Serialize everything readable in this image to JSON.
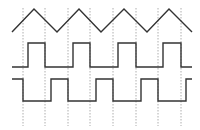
{
  "diagram": {
    "type": "timing-diagram",
    "background": "#ffffff",
    "line_color": "#333333",
    "grid_color": "#999999",
    "gridlines_x": [
      23,
      45,
      68,
      90,
      113,
      136,
      158,
      181
    ],
    "gridline_y_range": [
      8,
      126
    ],
    "signals": [
      {
        "name": "triangle-wave",
        "points": "12,32 34,9 57,32 79,9 101,32 124,9 147,32 169,9 192,32"
      },
      {
        "name": "square-wave-1",
        "points": "12,67 28,67 28,43 45,43 45,67 73,67 73,43 90,43 90,67 118,67 118,43 136,43 136,67 163,67 163,43 181,43 181,67 192,67"
      },
      {
        "name": "square-wave-2",
        "points": "12,79 23,79 23,101 51,101 51,79 68,79 68,101 96,101 96,79 113,79 113,101 141,101 141,79 158,79 158,101 186,101 186,79 192,79"
      }
    ]
  }
}
